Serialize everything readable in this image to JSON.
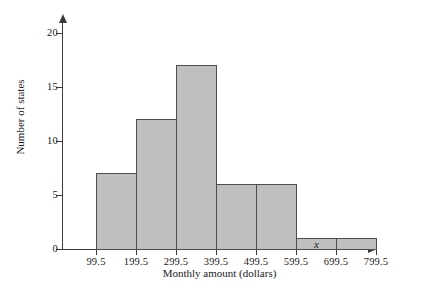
{
  "chart_data": {
    "type": "bar",
    "title": "",
    "subtitle": "",
    "xlabel": "Monthly amount (dollars)",
    "ylabel": "Number of states",
    "x_axis_variable": "x",
    "categories": [
      "99.5-199.5",
      "199.5-299.5",
      "299.5-399.5",
      "399.5-499.5",
      "499.5-599.5",
      "599.5-699.5",
      "699.5-799.5"
    ],
    "bin_edges": [
      99.5,
      199.5,
      299.5,
      399.5,
      499.5,
      599.5,
      699.5,
      799.5
    ],
    "values": [
      7,
      12,
      17,
      6,
      6,
      1,
      1
    ],
    "x_tick_labels": [
      "99.5",
      "199.5",
      "299.5",
      "399.5",
      "499.5",
      "599.5",
      "699.5",
      "799.5"
    ],
    "y_tick_labels": [
      "0",
      "5",
      "10",
      "15",
      "20"
    ],
    "y_ticks": [
      0,
      5,
      10,
      15,
      20
    ],
    "ylim": [
      0,
      21
    ],
    "xlim": [
      99.5,
      799.5
    ],
    "grid": false,
    "legend": false,
    "bar_fill_color": "#bfbfbf",
    "bar_edge_color": "#4d4d4d",
    "axis_color": "#3a3a3a",
    "background_color": "#ffffff"
  }
}
